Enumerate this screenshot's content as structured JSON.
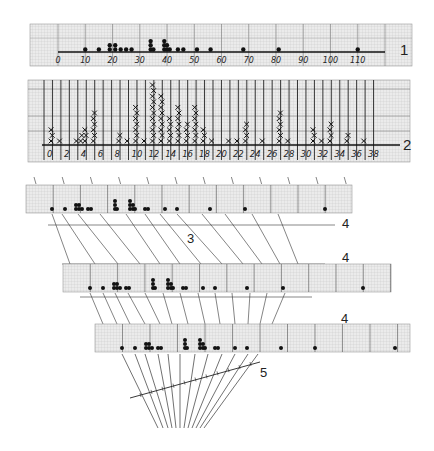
{
  "colors": {
    "paper": "#e9e9e9",
    "grid_minor": "#c8c8c8",
    "grid_major": "#333333",
    "ink": "#111111",
    "thin_line": "#444444"
  },
  "panel1": {
    "label": "1",
    "x_ticks": [
      "0",
      "10",
      "20",
      "30",
      "40",
      "50",
      "60",
      "70",
      "80",
      "90",
      "100",
      "110"
    ],
    "x_min": 0,
    "x_max": 120,
    "points": [
      {
        "x": 10,
        "n": 1
      },
      {
        "x": 15,
        "n": 1
      },
      {
        "x": 19,
        "n": 2
      },
      {
        "x": 21,
        "n": 2
      },
      {
        "x": 23,
        "n": 1
      },
      {
        "x": 25,
        "n": 1
      },
      {
        "x": 27,
        "n": 1
      },
      {
        "x": 34,
        "n": 3
      },
      {
        "x": 35,
        "n": 1
      },
      {
        "x": 39,
        "n": 3
      },
      {
        "x": 40,
        "n": 2
      },
      {
        "x": 41,
        "n": 1
      },
      {
        "x": 44,
        "n": 1
      },
      {
        "x": 46,
        "n": 1
      },
      {
        "x": 51,
        "n": 1
      },
      {
        "x": 56,
        "n": 1
      },
      {
        "x": 68,
        "n": 1
      },
      {
        "x": 81,
        "n": 1
      },
      {
        "x": 110,
        "n": 1
      }
    ]
  },
  "panel2": {
    "label": "2",
    "x_ticks": [
      "0",
      "2",
      "4",
      "6",
      "8",
      "10",
      "12",
      "14",
      "16",
      "18",
      "20",
      "22",
      "24",
      "26",
      "28",
      "30",
      "32",
      "34",
      "36",
      "38"
    ],
    "bins": [
      {
        "x": 1,
        "n": 3
      },
      {
        "x": 2,
        "n": 1
      },
      {
        "x": 4,
        "n": 1
      },
      {
        "x": 4.5,
        "n": 2
      },
      {
        "x": 5,
        "n": 3
      },
      {
        "x": 6,
        "n": 6
      },
      {
        "x": 9,
        "n": 2
      },
      {
        "x": 10,
        "n": 1
      },
      {
        "x": 11,
        "n": 7
      },
      {
        "x": 12,
        "n": 1
      },
      {
        "x": 13,
        "n": 11
      },
      {
        "x": 14,
        "n": 9
      },
      {
        "x": 15,
        "n": 5
      },
      {
        "x": 16,
        "n": 7
      },
      {
        "x": 17,
        "n": 4
      },
      {
        "x": 18,
        "n": 7
      },
      {
        "x": 19,
        "n": 3
      },
      {
        "x": 20,
        "n": 1
      },
      {
        "x": 22,
        "n": 1
      },
      {
        "x": 23,
        "n": 1
      },
      {
        "x": 24,
        "n": 4
      },
      {
        "x": 26,
        "n": 1
      },
      {
        "x": 28,
        "n": 6
      },
      {
        "x": 29,
        "n": 1
      },
      {
        "x": 32,
        "n": 3
      },
      {
        "x": 33,
        "n": 1
      },
      {
        "x": 34,
        "n": 4
      },
      {
        "x": 36,
        "n": 2
      },
      {
        "x": 38,
        "n": 1
      }
    ]
  },
  "panel3": {
    "labels": [
      "4",
      "3",
      "4"
    ],
    "step_label": "3"
  },
  "panel4": {
    "label": "4"
  },
  "panel5": {
    "label_4": "4",
    "label_5": "5"
  }
}
